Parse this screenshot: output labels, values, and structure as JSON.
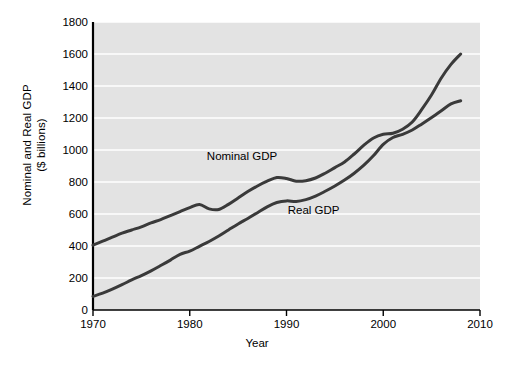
{
  "chart_data": {
    "type": "line",
    "title": "",
    "xlabel": "Year",
    "ylabel": "Nominal and Real GDP ($ billions)",
    "ylabel_line1": "Nominal and Real GDP",
    "ylabel_line2": "($ billions)",
    "xlim": [
      1970,
      2010
    ],
    "ylim": [
      0,
      1800
    ],
    "xticks": [
      1970,
      1980,
      1990,
      2000,
      2010
    ],
    "yticks": [
      0,
      200,
      400,
      600,
      800,
      1000,
      1200,
      1400,
      1600,
      1800
    ],
    "xtick_labels": [
      "1970",
      "1980",
      "1990",
      "2000",
      "2010"
    ],
    "ytick_labels": [
      "0",
      "200",
      "400",
      "600",
      "800",
      "1000",
      "1200",
      "1400",
      "1600",
      "1800"
    ],
    "grid": "horizontal",
    "legend_position": "inline-annotations",
    "plot_background": "#e3e3e3",
    "gridline_color": "#ffffff",
    "line_color": "#3a3a3a",
    "axis_color": "#000000",
    "x": [
      1970,
      1971,
      1972,
      1973,
      1974,
      1975,
      1976,
      1977,
      1978,
      1979,
      1980,
      1981,
      1982,
      1983,
      1984,
      1985,
      1986,
      1987,
      1988,
      1989,
      1990,
      1991,
      1992,
      1993,
      1994,
      1995,
      1996,
      1997,
      1998,
      1999,
      2000,
      2001,
      2002,
      2003,
      2004,
      2005,
      2006,
      2007,
      2008
    ],
    "series": [
      {
        "name": "Nominal GDP",
        "label": "Nominal GDP",
        "label_x": 1985.4,
        "label_y": 940,
        "values": [
          405,
          430,
          455,
          480,
          500,
          520,
          545,
          565,
          590,
          615,
          640,
          660,
          632,
          628,
          660,
          700,
          740,
          775,
          805,
          828,
          822,
          805,
          808,
          825,
          855,
          890,
          925,
          975,
          1030,
          1075,
          1098,
          1105,
          1130,
          1175,
          1255,
          1345,
          1450,
          1535,
          1600
        ]
      },
      {
        "name": "Real GDP",
        "label": "Real GDP",
        "label_x": 1992.8,
        "label_y": 598,
        "values": [
          85,
          105,
          130,
          158,
          188,
          215,
          245,
          278,
          312,
          348,
          368,
          398,
          428,
          462,
          500,
          538,
          572,
          608,
          645,
          672,
          682,
          678,
          690,
          712,
          742,
          775,
          812,
          855,
          905,
          965,
          1035,
          1078,
          1098,
          1125,
          1163,
          1203,
          1245,
          1288,
          1308
        ]
      }
    ]
  }
}
